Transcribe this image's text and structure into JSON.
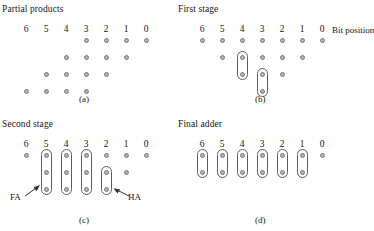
{
  "figure": {
    "bit_label_row": [
      "6",
      "5",
      "4",
      "3",
      "2",
      "1",
      "0"
    ],
    "bit_position_label": "Bit position",
    "dot_color": "#b2b2b2",
    "dot_border_color": "#7a7a7a",
    "capsule_border_color": "#5d5d5d"
  },
  "panels": [
    {
      "id": "a",
      "title": "Partial products",
      "caption": "(a)",
      "rows": [
        {
          "row": 0,
          "columns": [
            3,
            2,
            1,
            0
          ]
        },
        {
          "row": 1,
          "columns": [
            4,
            3,
            2,
            1
          ]
        },
        {
          "row": 2,
          "columns": [
            5,
            4,
            3,
            2
          ]
        },
        {
          "row": 3,
          "columns": [
            6,
            5,
            4,
            3
          ]
        }
      ],
      "capsules": [],
      "annotations": []
    },
    {
      "id": "b",
      "title": "First stage",
      "caption": "(b)",
      "rows": [
        {
          "row": 0,
          "columns": [
            6,
            5,
            4,
            3,
            2,
            1,
            0
          ]
        },
        {
          "row": 1,
          "columns": [
            5,
            4,
            3,
            2,
            1
          ]
        },
        {
          "row": 2,
          "columns": [
            4,
            3,
            2
          ]
        },
        {
          "row": 3,
          "columns": [
            3
          ]
        }
      ],
      "capsules": [
        {
          "column": 4,
          "from_row": 1,
          "to_row": 2,
          "cells": 2,
          "type": "half-adder"
        },
        {
          "column": 3,
          "from_row": 2,
          "to_row": 3,
          "cells": 2,
          "type": "half-adder"
        }
      ],
      "annotations": []
    },
    {
      "id": "c",
      "title": "Second stage",
      "caption": "(c)",
      "rows": [
        {
          "row": 0,
          "columns": [
            6,
            5,
            4,
            3,
            2,
            1,
            0
          ]
        },
        {
          "row": 1,
          "columns": [
            5,
            4,
            3,
            2,
            1
          ]
        },
        {
          "row": 2,
          "columns": [
            5,
            4,
            3,
            2
          ]
        }
      ],
      "capsules": [
        {
          "column": 5,
          "from_row": 0,
          "to_row": 2,
          "cells": 3,
          "type": "full-adder"
        },
        {
          "column": 4,
          "from_row": 0,
          "to_row": 2,
          "cells": 3,
          "type": "full-adder"
        },
        {
          "column": 3,
          "from_row": 0,
          "to_row": 2,
          "cells": 3,
          "type": "full-adder"
        },
        {
          "column": 2,
          "from_row": 1,
          "to_row": 2,
          "cells": 2,
          "type": "half-adder"
        }
      ],
      "annotations": [
        {
          "text": "FA",
          "points_to_column": 5,
          "side": "left"
        },
        {
          "text": "HA",
          "points_to_column": 2,
          "side": "right"
        }
      ]
    },
    {
      "id": "d",
      "title": "Final adder",
      "caption": "(d)",
      "rows": [
        {
          "row": 0,
          "columns": [
            6,
            5,
            4,
            3,
            2,
            1,
            0
          ]
        },
        {
          "row": 1,
          "columns": [
            6,
            5,
            4,
            3,
            2,
            1
          ]
        }
      ],
      "capsules": [
        {
          "column": 6,
          "from_row": 0,
          "to_row": 1,
          "cells": 2,
          "type": "adder-cell"
        },
        {
          "column": 5,
          "from_row": 0,
          "to_row": 1,
          "cells": 2,
          "type": "adder-cell"
        },
        {
          "column": 4,
          "from_row": 0,
          "to_row": 1,
          "cells": 2,
          "type": "adder-cell"
        },
        {
          "column": 3,
          "from_row": 0,
          "to_row": 1,
          "cells": 2,
          "type": "adder-cell"
        },
        {
          "column": 2,
          "from_row": 0,
          "to_row": 1,
          "cells": 2,
          "type": "adder-cell"
        },
        {
          "column": 1,
          "from_row": 0,
          "to_row": 1,
          "cells": 2,
          "type": "adder-cell"
        }
      ],
      "annotations": []
    }
  ]
}
